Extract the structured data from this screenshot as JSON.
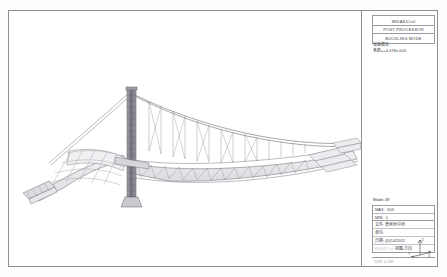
{
  "app": {
    "vendor_line1": "MIDAS/Civil",
    "vendor_line2": "POST-PROCESSOR",
    "vendor_line3": "BUCKLING MODE"
  },
  "subinfo": {
    "label_cn": "屈曲模态",
    "factor": "系数=+4.478e-003"
  },
  "legend": {
    "mode_label": "Mode  49",
    "max_label": "MAX : 103",
    "min_label": "MIN : 1",
    "file_row": "文件: 悬索桥中桥",
    "unit_row": "单位:",
    "date_row": "日期: 05/14/2011",
    "view_row": "视图-方向",
    "faint_row_1": "X-Y-Z-ROT",
    "faint_row_2": "MIDAS/Civil",
    "scale_note": "比例: 0.289"
  },
  "axes": {
    "x": "X",
    "y": "Y",
    "z": "Z"
  },
  "colors": {
    "frame": "#8e8e94",
    "structure": "#6e6e76",
    "deck_fill": "#e9e9ec",
    "cable": "#8a8a92",
    "pylon": "#7a7a82",
    "text": "#3a3a40"
  },
  "model": {
    "title": "buckling-mode-bridge-model",
    "description": "cable-stayed suspension bridge wireframe, buckling mode 49"
  }
}
